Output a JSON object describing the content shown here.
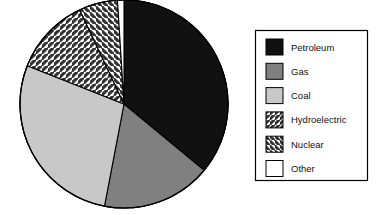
{
  "chart_data": {
    "type": "pie",
    "title": "",
    "subtitle": "",
    "xlabel": "",
    "ylabel": "",
    "grid": false,
    "legend_position": "right",
    "start_angle_deg": 0,
    "direction": "clockwise",
    "categories": [
      "Petroleum",
      "Gas",
      "Coal",
      "Hydroelectric",
      "Nuclear",
      "Other"
    ],
    "values": [
      36,
      17,
      28,
      12,
      6,
      1
    ],
    "unit": "percent",
    "slices": [
      {
        "label": "Petroleum",
        "value": 36,
        "start_deg": 0,
        "end_deg": 129.6,
        "fill": "#111111",
        "pattern": "solid"
      },
      {
        "label": "Gas",
        "value": 17,
        "start_deg": 129.6,
        "end_deg": 190.8,
        "fill": "#808080",
        "pattern": "solid"
      },
      {
        "label": "Coal",
        "value": 28,
        "start_deg": 190.8,
        "end_deg": 291.6,
        "fill": "#c8c8c8",
        "pattern": "solid"
      },
      {
        "label": "Hydroelectric",
        "value": 12,
        "start_deg": 291.6,
        "end_deg": 334.8,
        "fill": "#ffffff",
        "pattern": "hatch-forward"
      },
      {
        "label": "Nuclear",
        "value": 6,
        "start_deg": 334.8,
        "end_deg": 356.4,
        "fill": "#ffffff",
        "pattern": "hatch-backward"
      },
      {
        "label": "Other",
        "value": 1,
        "start_deg": 356.4,
        "end_deg": 360,
        "fill": "#ffffff",
        "pattern": "solid"
      }
    ]
  },
  "legend": {
    "items": [
      {
        "label": "Petroleum",
        "swatch": "solid-black-swatch"
      },
      {
        "label": "Gas",
        "swatch": "solid-darkgray-swatch"
      },
      {
        "label": "Coal",
        "swatch": "solid-lightgray-swatch"
      },
      {
        "label": "Hydroelectric",
        "swatch": "hatch-forward-swatch"
      },
      {
        "label": "Nuclear",
        "swatch": "hatch-backward-swatch"
      },
      {
        "label": "Other",
        "swatch": "solid-white-swatch"
      }
    ]
  },
  "colors": {
    "petroleum": "#111111",
    "gas": "#808080",
    "coal": "#c8c8c8",
    "hatch_line": "#333333",
    "other": "#ffffff",
    "outline": "#000000",
    "background": "#ffffff",
    "legend_border": "#000000",
    "text": "#111111"
  }
}
